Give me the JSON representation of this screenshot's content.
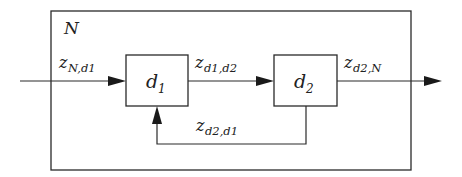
{
  "diagram": {
    "type": "block-diagram",
    "container": {
      "label": "N"
    },
    "blocks": [
      {
        "id": "d1",
        "label": "d",
        "subscript": "1"
      },
      {
        "id": "d2",
        "label": "d",
        "subscript": "2"
      }
    ],
    "signals": [
      {
        "id": "input",
        "label": "z",
        "subscript": "N,d1",
        "from": "outside",
        "to": "d1"
      },
      {
        "id": "d1_to_d2",
        "label": "z",
        "subscript": "d1,d2",
        "from": "d1",
        "to": "d2"
      },
      {
        "id": "output",
        "label": "z",
        "subscript": "d2,N",
        "from": "d2",
        "to": "outside"
      },
      {
        "id": "feedback",
        "label": "z",
        "subscript": "d2,d1",
        "from": "d2",
        "to": "d1"
      }
    ],
    "colors": {
      "line": "#2a2a2a",
      "background": "#ffffff"
    }
  }
}
